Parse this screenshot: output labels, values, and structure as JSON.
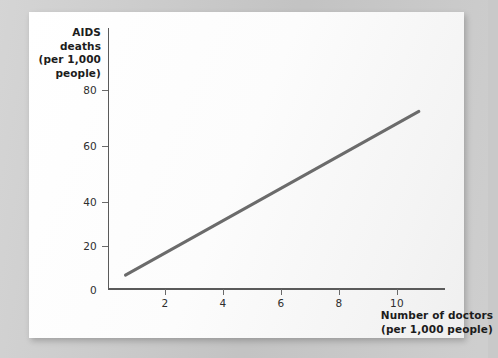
{
  "chart_data": {
    "type": "line",
    "title": "",
    "subtitle": "",
    "xlabel": "Number of doctors (per 1,000 people)",
    "ylabel": "AIDS deaths (per 1,000 people)",
    "xlabel_lines": [
      "Number of doctors",
      "(per 1,000 people)"
    ],
    "ylabel_lines": [
      "AIDS",
      "deaths",
      "(per 1,000",
      "people)"
    ],
    "grid": false,
    "legend": null,
    "xlim": [
      0,
      11.6
    ],
    "ylim": [
      0,
      88
    ],
    "xticks": [
      2,
      4,
      6,
      8,
      10
    ],
    "yticks": [
      0,
      20,
      40,
      60,
      80
    ],
    "xtick_labels": [
      "2",
      "4",
      "6",
      "8",
      "10"
    ],
    "ytick_labels": [
      "0",
      "20",
      "40",
      "60",
      "80"
    ],
    "series": [
      {
        "name": "AIDS deaths vs doctors",
        "color": "#6b6b6b",
        "line_width": 3,
        "x": [
          0.6,
          10.7
        ],
        "values": [
          5,
          60
        ],
        "points": [
          {
            "x": 0.6,
            "y": 5
          },
          {
            "x": 10.7,
            "y": 60
          }
        ]
      }
    ],
    "annotations": []
  },
  "axes": {
    "y_title_lines": [
      "AIDS",
      "deaths",
      "(per 1,000",
      "people)"
    ],
    "x_title_lines": [
      "Number of doctors",
      "(per 1,000 people)"
    ],
    "y_tick_labels": [
      "80",
      "60",
      "40",
      "20",
      "0"
    ],
    "x_tick_labels": [
      "2",
      "4",
      "6",
      "8",
      "10"
    ]
  },
  "colors": {
    "page_background": "#c9c9c9",
    "card_background": "#fdfdfd",
    "axis": "#5a5a5a",
    "series": "#6b6b6b",
    "text": "#1c1c1c",
    "tick_text": "#2e2e2e"
  }
}
